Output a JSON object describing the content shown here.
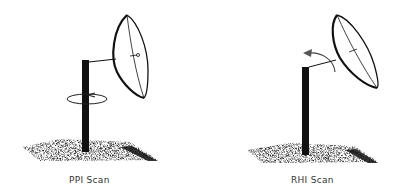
{
  "diagrams": [
    {
      "id": "ppi",
      "caption": "PPI Scan",
      "motion": "azimuth-rotation"
    },
    {
      "id": "rhi",
      "caption": "RHI Scan",
      "motion": "elevation-rotation"
    }
  ],
  "colors": {
    "ink": "#111111",
    "background": "#ffffff",
    "caption": "#333333"
  }
}
